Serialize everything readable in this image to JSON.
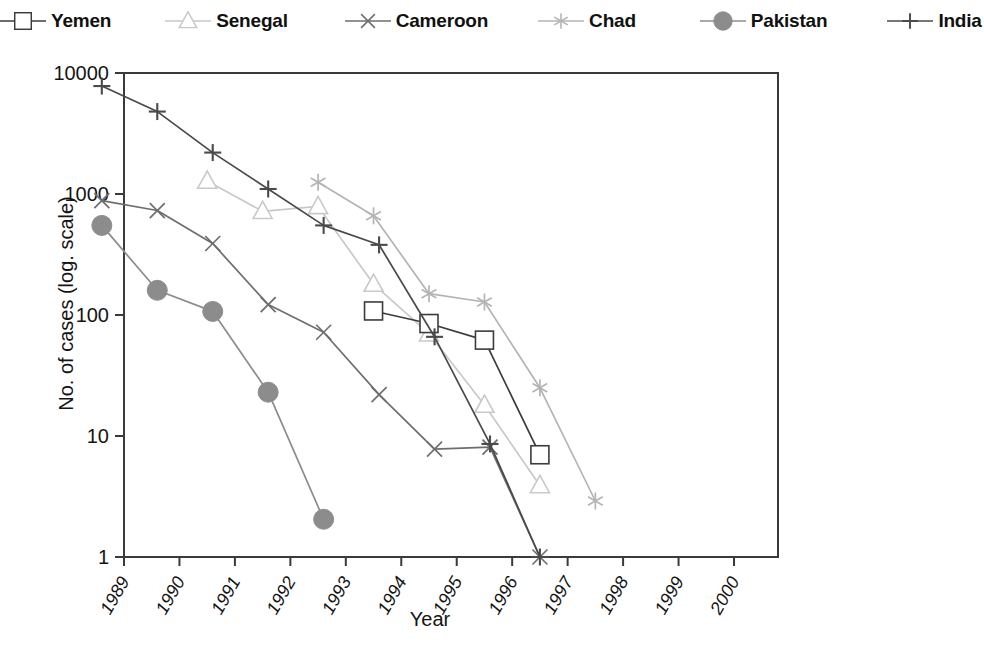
{
  "chart_data": {
    "type": "line",
    "title": "",
    "xlabel": "Year",
    "ylabel": "No. of cases (log. scale)",
    "yscale": "log",
    "ylim": [
      1,
      10000
    ],
    "ytick_labels": [
      "10000",
      "1000",
      "100",
      "10",
      "1"
    ],
    "ytick_values": [
      10000,
      1000,
      100,
      10,
      1
    ],
    "xlim": [
      1988.5,
      1999.5
    ],
    "xtick_labels": [
      "1989",
      "1990",
      "1991",
      "1992",
      "1993",
      "1994",
      "1995",
      "1996",
      "1997",
      "1998",
      "1999",
      "2000"
    ],
    "xtick_values": [
      1989,
      1990,
      1991,
      1992,
      1993,
      1994,
      1995,
      1996,
      1997,
      1998,
      1999,
      2000
    ],
    "grid": false,
    "legend_position": "top",
    "series": [
      {
        "name": "Yemen",
        "marker": "open-square",
        "color": "#3c3c3c",
        "x": [
          1993.5,
          1994.5,
          1995.5,
          1996.5
        ],
        "y": [
          108,
          85,
          62,
          7
        ]
      },
      {
        "name": "Senegal",
        "marker": "open-triangle",
        "color": "#c9c9c9",
        "x": [
          1990.5,
          1991.5,
          1992.5,
          1993.5,
          1994.5,
          1995.5,
          1996.5
        ],
        "y": [
          1280,
          720,
          790,
          180,
          70,
          18,
          3.9
        ]
      },
      {
        "name": "Cameroon",
        "marker": "cross-x",
        "color": "#6e6e6e",
        "x": [
          1988.6,
          1989.6,
          1990.6,
          1991.6,
          1992.6,
          1993.6,
          1994.6,
          1995.6,
          1996.5
        ],
        "y": [
          880,
          730,
          390,
          122,
          72,
          22,
          7.8,
          8.1,
          1
        ]
      },
      {
        "name": "Chad",
        "marker": "asterisk",
        "color": "#b4b4b4",
        "x": [
          1992.5,
          1993.5,
          1994.5,
          1995.5,
          1996.5,
          1997.5
        ],
        "y": [
          1250,
          660,
          150,
          128,
          25,
          2.9
        ]
      },
      {
        "name": "Pakistan",
        "marker": "filled-circle",
        "color": "#8c8c8c",
        "x": [
          1988.6,
          1989.6,
          1990.6,
          1991.6,
          1992.6
        ],
        "y": [
          550,
          160,
          107,
          23,
          2.05
        ]
      },
      {
        "name": "India",
        "marker": "plus",
        "color": "#4a4a4a",
        "x": [
          1988.6,
          1989.6,
          1990.6,
          1991.6,
          1992.6,
          1993.6,
          1994.6,
          1995.6,
          1996.5
        ],
        "y": [
          7800,
          4800,
          2200,
          1100,
          550,
          380,
          66,
          8.6,
          1
        ]
      }
    ]
  },
  "legend": {
    "items": [
      {
        "label": "Yemen"
      },
      {
        "label": "Senegal"
      },
      {
        "label": "Cameroon"
      },
      {
        "label": "Chad"
      },
      {
        "label": "Pakistan"
      },
      {
        "label": "India"
      }
    ]
  },
  "axis_titles": {
    "x": "Year",
    "y": "No. of cases (log. scale)"
  }
}
